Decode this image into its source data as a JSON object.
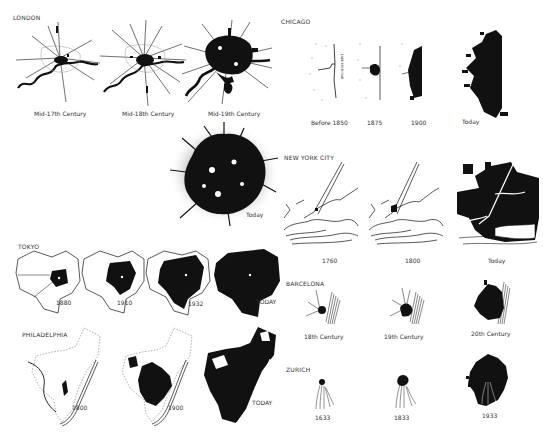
{
  "figure": {
    "ink_color": "#111111",
    "paper_color": "#ffffff",
    "stipple_color": "#9a9a9a"
  },
  "cities": {
    "london": {
      "name": "LONDON",
      "stages": [
        {
          "label": "Mid-17th Century"
        },
        {
          "label": "Mid-18th Century"
        },
        {
          "label": "Mid-19th Century"
        },
        {
          "label": "Today"
        }
      ]
    },
    "chicago": {
      "name": "CHICAGO",
      "annotation": "LAKE MICHIGAN",
      "stages": [
        {
          "label": "Before 1850"
        },
        {
          "label": "1875"
        },
        {
          "label": "1900"
        },
        {
          "label": "Today"
        }
      ]
    },
    "new_york": {
      "name": "NEW YORK CITY",
      "stages": [
        {
          "label": "1760"
        },
        {
          "label": "1800"
        },
        {
          "label": "Today"
        }
      ]
    },
    "tokyo": {
      "name": "TOKYO",
      "stages": [
        {
          "label": "1880"
        },
        {
          "label": "1910"
        },
        {
          "label": "1932"
        },
        {
          "label": "TODAY"
        }
      ]
    },
    "barcelona": {
      "name": "BARCELONA",
      "stages": [
        {
          "label": "18th Century"
        },
        {
          "label": "19th Century"
        },
        {
          "label": "20th Century"
        }
      ]
    },
    "philadelphia": {
      "name": "PHILADELPHIA",
      "stages": [
        {
          "label": "1800"
        },
        {
          "label": "1900"
        },
        {
          "label": "TODAY"
        }
      ]
    },
    "zurich": {
      "name": "ZURICH",
      "stages": [
        {
          "label": "1633"
        },
        {
          "label": "1833"
        },
        {
          "label": "1933"
        }
      ]
    }
  }
}
